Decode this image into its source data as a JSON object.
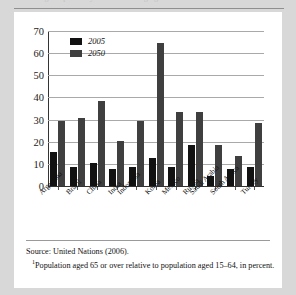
{
  "page": {
    "clipped_heading": "Old-Age Dependency Ratios in Emerging Market Economies"
  },
  "chart_data": {
    "type": "bar",
    "title": "",
    "subtitle": "",
    "xlabel": "",
    "ylabel": "",
    "ylim": [
      0,
      70
    ],
    "yticks": [
      0,
      10,
      20,
      30,
      40,
      50,
      60,
      70
    ],
    "ytick_labels": [
      "0",
      "10",
      "20",
      "30",
      "40",
      "50",
      "60",
      "70"
    ],
    "grid": true,
    "legend_position": "top-left",
    "categories": [
      "Argentina",
      "Brazil",
      "China",
      "India",
      "Indonesia",
      "Korea",
      "Mexico",
      "Russia",
      "Saudi Arabia",
      "South Africa",
      "Turkey"
    ],
    "series": [
      {
        "name": "2005",
        "color": "#121212",
        "values": [
          16,
          9,
          11,
          8,
          9,
          13,
          9,
          19,
          5,
          8,
          9
        ]
      },
      {
        "name": "2050",
        "color": "#3f3f3f",
        "values": [
          30,
          31,
          39,
          21,
          30,
          65,
          34,
          34,
          19,
          14,
          29
        ]
      }
    ]
  },
  "notes": {
    "source": "Source: United Nations (2006).",
    "footnote_marker": "1",
    "footnote": "Population aged 65 or over relative to population aged 15–64, in percent."
  }
}
